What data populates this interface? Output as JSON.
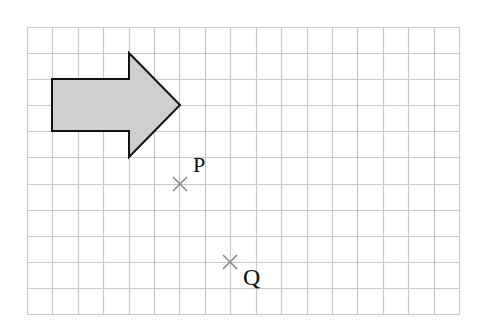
{
  "grid": {
    "x0": 27,
    "y0": 27,
    "x1": 459,
    "y1": 314,
    "cols": 17,
    "rows": 11,
    "line_color": "#c9c9c9"
  },
  "arrow": {
    "fill": "#cfcfcf",
    "stroke": "#111111",
    "points": [
      [
        52,
        79
      ],
      [
        129,
        79
      ],
      [
        129,
        53
      ],
      [
        180,
        105
      ],
      [
        129,
        157
      ],
      [
        129,
        131
      ],
      [
        52,
        131
      ]
    ]
  },
  "points": [
    {
      "label": "P",
      "x": 180,
      "y": 184,
      "label_x": 193,
      "label_y": 172
    },
    {
      "label": "Q",
      "x": 230,
      "y": 262,
      "label_x": 243,
      "label_y": 285
    }
  ],
  "marker_color": "#8a8a8a"
}
